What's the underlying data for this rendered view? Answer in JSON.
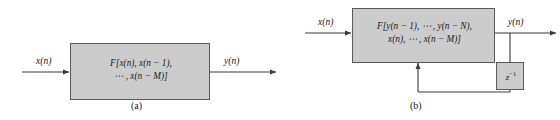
{
  "figure": {
    "background_color": "#ffffff",
    "box_fill_color": "#cccccc",
    "box_border_color": "#5a5a5a",
    "line_color": "#3a3a3a",
    "text_color": "#1a1a1a"
  },
  "panel_a": {
    "caption": "(a)",
    "input_label": "x(n)",
    "output_label": "y(n)",
    "block": {
      "line1": "F[x(n), x(n − 1),",
      "line2": "⋯ , x(n − M)]"
    }
  },
  "panel_b": {
    "caption": "(b)",
    "input_label": "x(n)",
    "output_label": "y(n)",
    "block": {
      "line1": "F[y(n − 1), ⋯ , y(n − N),",
      "line2": "x(n), ⋯ , x(n − M)]"
    },
    "delay": {
      "base": "z",
      "exponent": "−1"
    }
  }
}
